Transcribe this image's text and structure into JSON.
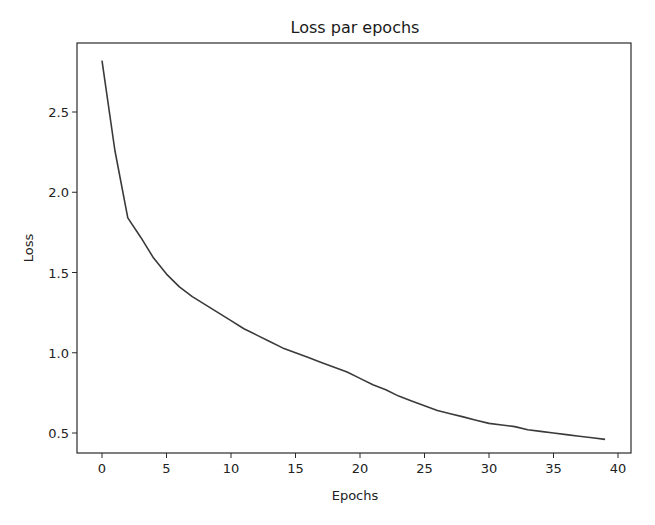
{
  "chart_data": {
    "type": "line",
    "title": "Loss par epochs",
    "xlabel": "Epochs",
    "ylabel": "Loss",
    "xlim": [
      -2,
      41
    ],
    "ylim": [
      0.37,
      2.93
    ],
    "xticks": [
      0,
      5,
      10,
      15,
      20,
      25,
      30,
      35,
      40
    ],
    "xtick_labels": [
      "0",
      "5",
      "10",
      "15",
      "20",
      "25",
      "30",
      "35",
      "40"
    ],
    "yticks": [
      0.5,
      1.0,
      1.5,
      2.0,
      2.5
    ],
    "ytick_labels": [
      "0.5",
      "1.0",
      "1.5",
      "2.0",
      "2.5"
    ],
    "grid": false,
    "legend": null,
    "series": [
      {
        "name": "loss",
        "color": "#3a3a3a",
        "x": [
          0,
          1,
          2,
          3,
          4,
          5,
          6,
          7,
          8,
          9,
          10,
          11,
          12,
          13,
          14,
          15,
          16,
          17,
          18,
          19,
          20,
          21,
          22,
          23,
          24,
          25,
          26,
          27,
          28,
          29,
          30,
          31,
          32,
          33,
          34,
          35,
          36,
          37,
          38,
          39
        ],
        "values": [
          2.82,
          2.26,
          1.84,
          1.72,
          1.59,
          1.49,
          1.41,
          1.35,
          1.3,
          1.25,
          1.2,
          1.15,
          1.11,
          1.07,
          1.03,
          1.0,
          0.97,
          0.94,
          0.91,
          0.88,
          0.84,
          0.8,
          0.77,
          0.73,
          0.7,
          0.67,
          0.64,
          0.62,
          0.6,
          0.58,
          0.56,
          0.55,
          0.54,
          0.52,
          0.51,
          0.5,
          0.49,
          0.48,
          0.47,
          0.46
        ]
      }
    ]
  }
}
